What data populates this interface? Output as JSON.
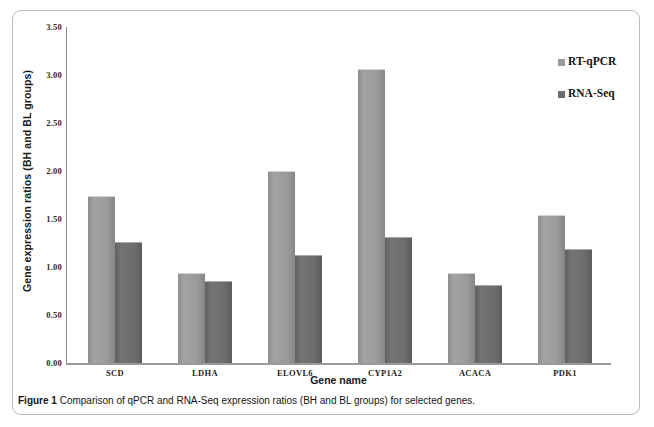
{
  "figure": {
    "caption_label": "Figure 1",
    "caption_text": "Comparison of qPCR and RNA-Seq expression ratios (BH and BL groups) for selected genes."
  },
  "chart_data": {
    "type": "bar",
    "title": "",
    "xlabel": "Gene name",
    "ylabel": "Gene  expression ratios (BH and BL groups)",
    "categories": [
      "SCD",
      "LDHA",
      "ELOVL6",
      "CYP1A2",
      "ACACA",
      "PDK1"
    ],
    "series": [
      {
        "name": "RT-qPCR",
        "color": "#9a9a9a",
        "values": [
          1.74,
          0.94,
          2.0,
          3.06,
          0.94,
          1.54
        ]
      },
      {
        "name": "RNA-Seq",
        "color": "#6d6d6d",
        "values": [
          1.26,
          0.85,
          1.13,
          1.31,
          0.81,
          1.19
        ]
      }
    ],
    "ylim": [
      0.0,
      3.5
    ],
    "ytick_step": 0.5,
    "ytick_labels": [
      "3.50",
      "3.00",
      "2.50",
      "2.00",
      "1.50",
      "1.00",
      "0.50",
      "0.00"
    ],
    "ytick_values": [
      3.5,
      3.0,
      2.5,
      2.0,
      1.5,
      1.0,
      0.5,
      0.0
    ],
    "grid": false,
    "legend_position": "right"
  }
}
